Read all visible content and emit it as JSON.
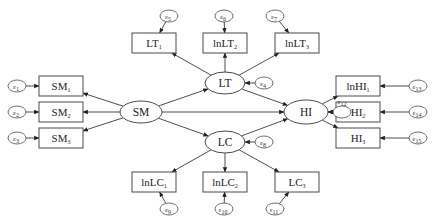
{
  "diagram": {
    "type": "structural-equation-model",
    "latent_variables": [
      {
        "id": "SM",
        "label": "SM"
      },
      {
        "id": "LT",
        "label": "LT"
      },
      {
        "id": "LC",
        "label": "LC"
      },
      {
        "id": "HI",
        "label": "HI"
      }
    ],
    "observed_variables": [
      {
        "id": "SM1",
        "base": "SM",
        "sub": "1",
        "latent": "SM",
        "error": "e1"
      },
      {
        "id": "SM2",
        "base": "SM",
        "sub": "2",
        "latent": "SM",
        "error": "e2"
      },
      {
        "id": "SM3",
        "base": "SM",
        "sub": "3",
        "latent": "SM",
        "error": "e3"
      },
      {
        "id": "LT1",
        "base": "LT",
        "sub": "1",
        "latent": "LT",
        "error": "e5"
      },
      {
        "id": "lnLT2",
        "base": "lnLT",
        "sub": "2",
        "latent": "LT",
        "error": "e6"
      },
      {
        "id": "lnLT3",
        "base": "lnLT",
        "sub": "3",
        "latent": "LT",
        "error": "e7"
      },
      {
        "id": "lnLC1",
        "base": "lnLC",
        "sub": "1",
        "latent": "LC",
        "error": "e9"
      },
      {
        "id": "lnLC2",
        "base": "lnLC",
        "sub": "2",
        "latent": "LC",
        "error": "e10"
      },
      {
        "id": "LC3",
        "base": "LC",
        "sub": "3",
        "latent": "LC",
        "error": "e11"
      },
      {
        "id": "lnHI1",
        "base": "lnHI",
        "sub": "1",
        "latent": "HI",
        "error": "e13"
      },
      {
        "id": "HI2",
        "base": "HI",
        "sub": "2",
        "latent": "HI",
        "error": "e14"
      },
      {
        "id": "HI3",
        "base": "HI",
        "sub": "3",
        "latent": "HI",
        "error": "e15"
      }
    ],
    "error_terms": [
      {
        "id": "e1",
        "symbol": "ε",
        "sub": "1"
      },
      {
        "id": "e2",
        "symbol": "ε",
        "sub": "2"
      },
      {
        "id": "e3",
        "symbol": "ε",
        "sub": "3"
      },
      {
        "id": "e4",
        "symbol": "ε",
        "sub": "4",
        "target": "LT"
      },
      {
        "id": "e5",
        "symbol": "ε",
        "sub": "5"
      },
      {
        "id": "e6",
        "symbol": "ε",
        "sub": "6"
      },
      {
        "id": "e7",
        "symbol": "ε",
        "sub": "7"
      },
      {
        "id": "e8",
        "symbol": "ε",
        "sub": "8",
        "target": "LC"
      },
      {
        "id": "e9",
        "symbol": "ε",
        "sub": "9"
      },
      {
        "id": "e10",
        "symbol": "ε",
        "sub": "10"
      },
      {
        "id": "e11",
        "symbol": "ε",
        "sub": "11"
      },
      {
        "id": "e12",
        "symbol": "ε",
        "sub": "12",
        "target": "HI"
      },
      {
        "id": "e13",
        "symbol": "ε",
        "sub": "13"
      },
      {
        "id": "e14",
        "symbol": "ε",
        "sub": "14"
      },
      {
        "id": "e15",
        "symbol": "ε",
        "sub": "15"
      }
    ],
    "structural_paths": [
      {
        "from": "SM",
        "to": "LT"
      },
      {
        "from": "SM",
        "to": "LC"
      },
      {
        "from": "SM",
        "to": "HI"
      },
      {
        "from": "LT",
        "to": "HI"
      },
      {
        "from": "LC",
        "to": "HI"
      }
    ]
  }
}
